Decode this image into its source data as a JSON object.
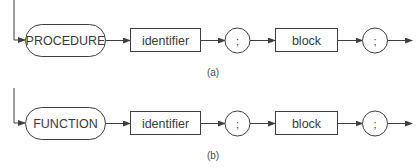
{
  "diagram": {
    "type": "syntax-diagram",
    "colors": {
      "line": "#3f3f3f",
      "text": "#3a3a3a",
      "background": "#ffffff"
    },
    "rows": [
      {
        "caption": "(a)",
        "nodes": [
          {
            "kind": "terminal-pill",
            "label": "PROCEDURE"
          },
          {
            "kind": "nonterminal-box",
            "label": "identifier"
          },
          {
            "kind": "terminal-circle",
            "label": ";"
          },
          {
            "kind": "nonterminal-box",
            "label": "block"
          },
          {
            "kind": "terminal-circle",
            "label": ";"
          }
        ]
      },
      {
        "caption": "(b)",
        "nodes": [
          {
            "kind": "terminal-pill",
            "label": "FUNCTION"
          },
          {
            "kind": "nonterminal-box",
            "label": "identifier"
          },
          {
            "kind": "terminal-circle",
            "label": ";"
          },
          {
            "kind": "nonterminal-box",
            "label": "block"
          },
          {
            "kind": "terminal-circle",
            "label": ";"
          }
        ]
      }
    ]
  }
}
